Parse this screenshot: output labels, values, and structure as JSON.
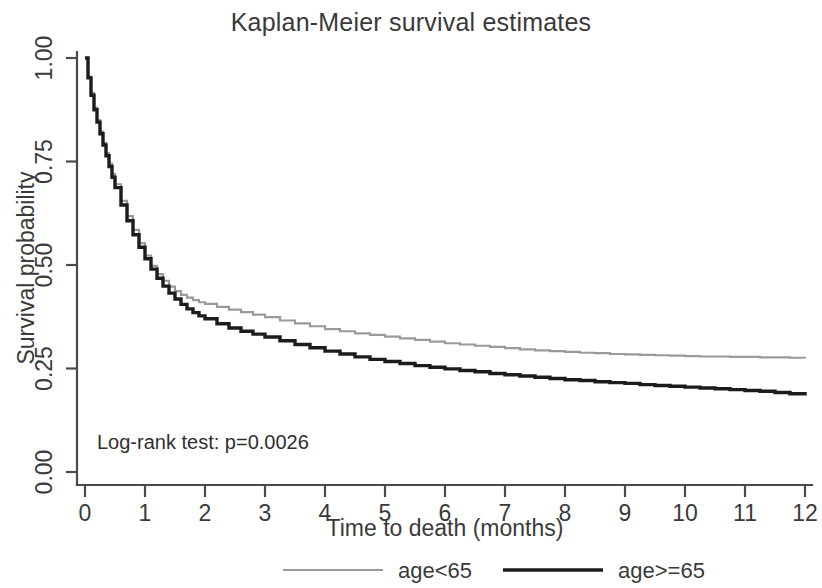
{
  "chart_data": {
    "type": "line",
    "title": "Kaplan-Meier survival estimates",
    "xlabel": "Time to death (months)",
    "ylabel": "Survival probability",
    "xlim": [
      0,
      12
    ],
    "ylim": [
      0,
      1.0
    ],
    "grid": false,
    "legend_position": "bottom",
    "annotation": "Log-rank test: p=0.0026",
    "xticks": [
      "0",
      "1",
      "2",
      "3",
      "4",
      "5",
      "6",
      "7",
      "8",
      "9",
      "10",
      "11",
      "12"
    ],
    "xtick_values": [
      0,
      1,
      2,
      3,
      4,
      5,
      6,
      7,
      8,
      9,
      10,
      11,
      12
    ],
    "yticks": [
      "0.00",
      "0.25",
      "0.50",
      "0.75",
      "1.00"
    ],
    "ytick_values": [
      0.0,
      0.25,
      0.5,
      0.75,
      1.0
    ],
    "x": [
      0.0,
      0.05,
      0.1,
      0.15,
      0.2,
      0.25,
      0.3,
      0.35,
      0.4,
      0.45,
      0.5,
      0.6,
      0.7,
      0.8,
      0.9,
      1.0,
      1.1,
      1.2,
      1.3,
      1.4,
      1.5,
      1.6,
      1.7,
      1.8,
      1.9,
      2.0,
      2.2,
      2.4,
      2.6,
      2.8,
      3.0,
      3.25,
      3.5,
      3.75,
      4.0,
      4.25,
      4.5,
      4.75,
      5.0,
      5.25,
      5.5,
      5.75,
      6.0,
      6.25,
      6.5,
      6.75,
      7.0,
      7.25,
      7.5,
      7.75,
      8.0,
      8.25,
      8.5,
      8.75,
      9.0,
      9.25,
      9.5,
      9.75,
      10.0,
      10.25,
      10.5,
      10.75,
      11.0,
      11.25,
      11.5,
      11.75,
      12.0
    ],
    "series": [
      {
        "name": "age<65",
        "color": "#9a9a9a",
        "linewidth": 2.2,
        "values": [
          1.0,
          0.955,
          0.915,
          0.88,
          0.85,
          0.822,
          0.795,
          0.77,
          0.745,
          0.72,
          0.695,
          0.655,
          0.618,
          0.585,
          0.553,
          0.523,
          0.498,
          0.478,
          0.462,
          0.448,
          0.437,
          0.428,
          0.421,
          0.415,
          0.41,
          0.406,
          0.399,
          0.392,
          0.386,
          0.38,
          0.374,
          0.366,
          0.359,
          0.352,
          0.345,
          0.34,
          0.335,
          0.331,
          0.327,
          0.323,
          0.319,
          0.315,
          0.311,
          0.308,
          0.305,
          0.302,
          0.299,
          0.296,
          0.294,
          0.292,
          0.29,
          0.288,
          0.287,
          0.285,
          0.284,
          0.283,
          0.282,
          0.281,
          0.28,
          0.279,
          0.279,
          0.278,
          0.278,
          0.277,
          0.277,
          0.276,
          0.275
        ]
      },
      {
        "name": "age>=65",
        "color": "#1c1c1c",
        "linewidth": 3.4,
        "values": [
          1.0,
          0.952,
          0.91,
          0.875,
          0.845,
          0.817,
          0.79,
          0.764,
          0.738,
          0.712,
          0.687,
          0.645,
          0.607,
          0.573,
          0.543,
          0.515,
          0.49,
          0.468,
          0.449,
          0.432,
          0.418,
          0.405,
          0.394,
          0.385,
          0.377,
          0.37,
          0.358,
          0.348,
          0.34,
          0.333,
          0.326,
          0.317,
          0.308,
          0.3,
          0.292,
          0.285,
          0.278,
          0.272,
          0.267,
          0.262,
          0.257,
          0.253,
          0.249,
          0.245,
          0.242,
          0.238,
          0.235,
          0.232,
          0.229,
          0.226,
          0.223,
          0.221,
          0.218,
          0.216,
          0.214,
          0.211,
          0.209,
          0.207,
          0.205,
          0.203,
          0.201,
          0.199,
          0.197,
          0.195,
          0.192,
          0.189,
          0.185
        ]
      }
    ]
  },
  "legend": {
    "entries": [
      {
        "label": "age<65",
        "color": "#9a9a9a"
      },
      {
        "label": "age>=65",
        "color": "#1c1c1c"
      }
    ]
  }
}
